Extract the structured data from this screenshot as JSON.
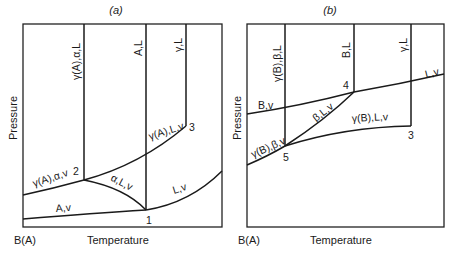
{
  "panels": [
    {
      "title": "(a)",
      "y_axis_label": "Pressure",
      "x_axis_label": "Temperature",
      "origin_label": "B(A)",
      "regions": {
        "gamma_A_alpha_L": "γ(A),α,L",
        "A_L": "A,L",
        "gamma_L": "γ,L",
        "gamma_A_L_v": "γ(A),L,v",
        "gamma_A_alpha_v": "γ(A),α,v",
        "alpha_L_v": "α,L,v",
        "L_v": "L,v",
        "A_v": "A,v"
      },
      "points": {
        "p1": "1",
        "p2": "2",
        "p3": "3"
      }
    },
    {
      "title": "(b)",
      "y_axis_label": "Pressure",
      "x_axis_label": "Temperature",
      "origin_label": "B(A)",
      "regions": {
        "gamma_B_beta_L": "γ(B),β,L",
        "B_L": "B,L",
        "gamma_L": "γ,L",
        "L_v": "L,v",
        "B_v": "B,v",
        "beta_L_v": "β,L,v",
        "gamma_B_L_v": "γ(B),L,v",
        "gamma_B_beta_v": "γ(B),β,v"
      },
      "points": {
        "p3": "3",
        "p4": "4",
        "p5": "5"
      }
    }
  ]
}
